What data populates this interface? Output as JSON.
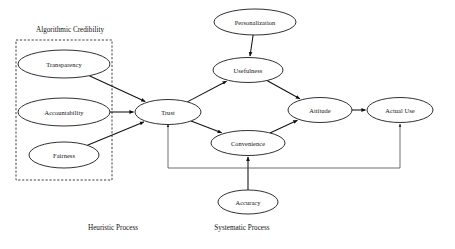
{
  "diagram": {
    "type": "path-model",
    "canvas": {
      "width": 455,
      "height": 249
    },
    "colors": {
      "node_fill": "#ffffff",
      "node_stroke": "#1a1a1a",
      "edge": "#111111",
      "group_border": "#2a2a2a",
      "text": "#111111",
      "background": "#ffffff"
    },
    "group": {
      "label": "Algorithmic Credibility",
      "style": "dashed-rectangle",
      "x": 16,
      "y": 40,
      "width": 96,
      "height": 140,
      "title_x": 70,
      "title_y": 30
    },
    "nodes": [
      {
        "id": "transparency",
        "label": "Transparency",
        "cx": 64,
        "cy": 64,
        "rx": 46,
        "ry": 14
      },
      {
        "id": "accountability",
        "label": "Accountability",
        "cx": 64,
        "cy": 112,
        "rx": 46,
        "ry": 14
      },
      {
        "id": "fairness",
        "label": "Fairness",
        "cx": 64,
        "cy": 155,
        "rx": 35,
        "ry": 13
      },
      {
        "id": "trust",
        "label": "Trust",
        "cx": 168,
        "cy": 112,
        "rx": 33,
        "ry": 12.5
      },
      {
        "id": "personalization",
        "label": "Personalization",
        "cx": 255,
        "cy": 22,
        "rx": 41,
        "ry": 13
      },
      {
        "id": "usefulness",
        "label": "Usefulness",
        "cx": 248,
        "cy": 70,
        "rx": 35,
        "ry": 12.5
      },
      {
        "id": "convenience",
        "label": "Convenience",
        "cx": 248,
        "cy": 143,
        "rx": 37,
        "ry": 12.5
      },
      {
        "id": "accuracy",
        "label": "Accuracy",
        "cx": 248,
        "cy": 202,
        "rx": 30,
        "ry": 12
      },
      {
        "id": "attitude",
        "label": "Attitude",
        "cx": 320,
        "cy": 110,
        "rx": 32,
        "ry": 12.5
      },
      {
        "id": "actual_use",
        "label": "Actual Use",
        "cx": 400,
        "cy": 110,
        "rx": 33,
        "ry": 12.5
      }
    ],
    "edges": [
      {
        "from": "transparency",
        "to": "trust",
        "kind": "straight"
      },
      {
        "from": "accountability",
        "to": "trust",
        "kind": "straight"
      },
      {
        "from": "fairness",
        "to": "trust",
        "kind": "straight"
      },
      {
        "from": "personalization",
        "to": "usefulness",
        "kind": "straight"
      },
      {
        "from": "trust",
        "to": "usefulness",
        "kind": "straight"
      },
      {
        "from": "trust",
        "to": "convenience",
        "kind": "straight"
      },
      {
        "from": "usefulness",
        "to": "attitude",
        "kind": "straight"
      },
      {
        "from": "convenience",
        "to": "attitude",
        "kind": "straight"
      },
      {
        "from": "accuracy",
        "to": "convenience",
        "kind": "straight"
      },
      {
        "from": "attitude",
        "to": "actual_use",
        "kind": "straight"
      },
      {
        "from": "trust",
        "to": "actual_use",
        "kind": "orthogonal-bottom"
      }
    ],
    "process_labels": [
      {
        "id": "heuristic",
        "label": "Heuristic Process",
        "x": 113,
        "y": 228
      },
      {
        "id": "systematic",
        "label": "Systematic Process",
        "x": 242,
        "y": 228
      }
    ]
  }
}
